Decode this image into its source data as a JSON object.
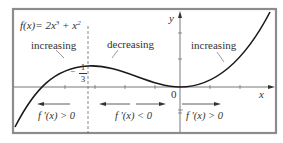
{
  "figure": {
    "function_label": {
      "prefix": "f(x)= 2x",
      "exp1": "3",
      "middle": " + x",
      "exp2": "2"
    },
    "regions": [
      {
        "label": "increasing",
        "derivative": "f '(x) > 0",
        "interval": "x < -1/3",
        "arrow": "left"
      },
      {
        "label": "decreasing",
        "derivative": "f '(x) < 0",
        "interval": "-1/3 < x < 0",
        "arrow": "both"
      },
      {
        "label": "increasing",
        "derivative": "f '(x) > 0",
        "interval": "x > 0",
        "arrow": "right"
      }
    ],
    "axes": {
      "x_label": "x",
      "y_label": "y",
      "origin_label": "0"
    },
    "critical_point": {
      "sign": "−",
      "numerator": "1",
      "denominator": "3"
    },
    "colors": {
      "frame": "#8c8c8c",
      "curve": "#1a1a1a",
      "axis": "#444444",
      "text": "#333333"
    }
  }
}
